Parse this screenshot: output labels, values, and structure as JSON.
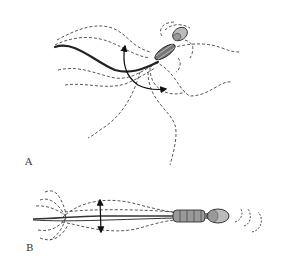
{
  "figure": {
    "panels": [
      {
        "label": "A",
        "view": "sperm swimming with curved flagellum; dashed flow lines and curved arrow indicating beat direction"
      },
      {
        "label": "B",
        "view": "side view of sperm with straight flagellum; dashed envelope showing beat amplitude with double-headed arrow"
      }
    ]
  },
  "colors": {
    "background": "#ffffff",
    "line": "#222222",
    "head_fill": "#bbbbbb",
    "label": "#333333"
  }
}
